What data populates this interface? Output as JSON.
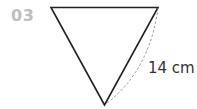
{
  "figure": {
    "number": "03",
    "shape": "inverted-equilateral-triangle",
    "side_label": "14 cm",
    "colors": {
      "number": "#bdbdbd",
      "stroke": "#222222",
      "dashed_arc": "#888888",
      "label": "#333333"
    }
  }
}
